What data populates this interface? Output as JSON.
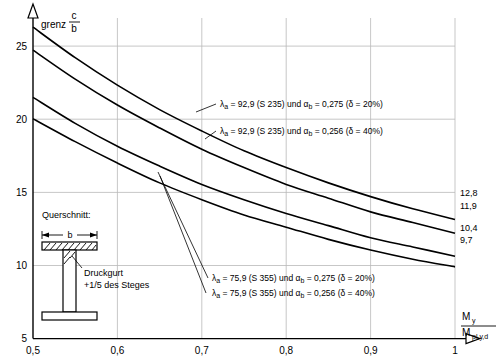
{
  "chart_data": {
    "type": "line",
    "title": "",
    "ylabel_parts": {
      "main": "grenz",
      "num": "c",
      "den": "b"
    },
    "xlabel_parts": {
      "num": "M",
      "num_sub": "y",
      "den": "M",
      "den_sub": "pl,y,d"
    },
    "xlim": [
      0.5,
      1.0
    ],
    "ylim": [
      5,
      26
    ],
    "xticks": [
      "0,5",
      "0,6",
      "0,7",
      "0,8",
      "0,9",
      "1"
    ],
    "xtick_values": [
      0.5,
      0.6,
      0.7,
      0.8,
      0.9,
      1.0
    ],
    "yticks": [
      "5",
      "10",
      "15",
      "20",
      "25"
    ],
    "ytick_values": [
      5,
      10,
      15,
      20,
      25
    ],
    "grid": true,
    "series": [
      {
        "name": "lambda_a = 92,9 (S 235) und alpha_b = 0,275 (delta = 20%)",
        "end_label": "12,8",
        "x": [
          0.5,
          0.55,
          0.6,
          0.65,
          0.7,
          0.75,
          0.8,
          0.85,
          0.9,
          0.95,
          1.0
        ],
        "y": [
          25.4,
          23.4,
          21.6,
          20.0,
          18.6,
          17.3,
          16.2,
          15.2,
          14.3,
          13.5,
          12.8
        ]
      },
      {
        "name": "lambda_a = 92,9 (S 235) und alpha_b = 0,256 (delta = 40%)",
        "end_label": "11,9",
        "x": [
          0.5,
          0.55,
          0.6,
          0.65,
          0.7,
          0.75,
          0.8,
          0.85,
          0.9,
          0.95,
          1.0
        ],
        "y": [
          23.9,
          22.0,
          20.3,
          18.8,
          17.4,
          16.2,
          15.1,
          14.2,
          13.3,
          12.6,
          11.9
        ]
      },
      {
        "name": "lambda_a = 75,9 (S 355) und alpha_b = 0,275 (delta = 20%)",
        "end_label": "10,4",
        "x": [
          0.5,
          0.55,
          0.6,
          0.65,
          0.7,
          0.75,
          0.8,
          0.85,
          0.9,
          0.95,
          1.0
        ],
        "y": [
          20.8,
          19.1,
          17.6,
          16.3,
          15.1,
          14.1,
          13.2,
          12.4,
          11.6,
          11.0,
          10.4
        ]
      },
      {
        "name": "lambda_a = 75,9 (S 355) und alpha_b = 0,256 (delta = 40%)",
        "end_label": "9,7",
        "x": [
          0.5,
          0.55,
          0.6,
          0.65,
          0.7,
          0.75,
          0.8,
          0.85,
          0.9,
          0.95,
          1.0
        ],
        "y": [
          19.4,
          17.9,
          16.5,
          15.2,
          14.1,
          13.1,
          12.3,
          11.5,
          10.8,
          10.2,
          9.7
        ]
      }
    ],
    "annotations": [
      {
        "id": "ann1",
        "lambda": "λ",
        "sub": "a",
        "text_a": " = 92,9 (S 235) und α",
        "sub_b": "b",
        "text_b": " = 0,275 (δ = 20%)"
      },
      {
        "id": "ann2",
        "lambda": "λ",
        "sub": "a",
        "text_a": " = 92,9 (S 235) und α",
        "sub_b": "b",
        "text_b": " = 0,256 (δ = 40%)"
      },
      {
        "id": "ann3",
        "lambda": "λ",
        "sub": "a",
        "text_a": " = 75,9 (S 355) und α",
        "sub_b": "b",
        "text_b": " = 0,275 (δ = 20%)"
      },
      {
        "id": "ann4",
        "lambda": "λ",
        "sub": "a",
        "text_a": " = 75,9 (S 355) und α",
        "sub_b": "b",
        "text_b": " = 0,256 (δ = 40%)"
      }
    ],
    "section_inset": {
      "caption": "Querschnitt:",
      "dim_label": "b",
      "note_line1": "Druckgurt",
      "note_line2": "+1/5 des Steges"
    }
  }
}
